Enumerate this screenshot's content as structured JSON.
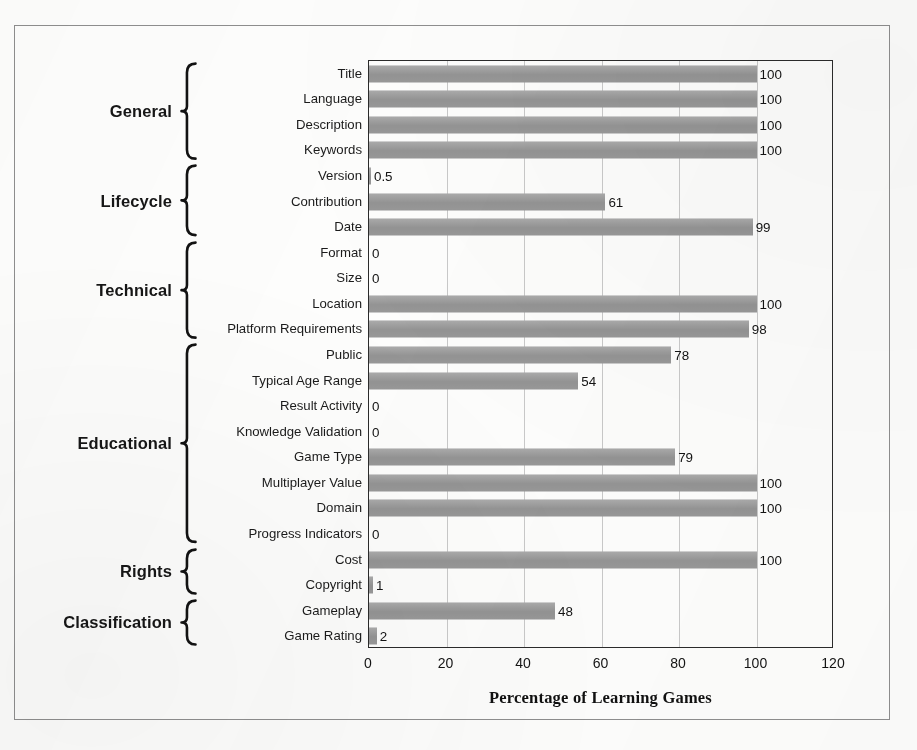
{
  "figure": {
    "kind": "horizontal-bar-chart",
    "frame_border_color": "#8e8e8e",
    "bar_color": "#9b9b9b",
    "axis_color": "#2b2b2b",
    "gridline_color": "#c9c9c9"
  },
  "chart_data": {
    "type": "bar",
    "orientation": "horizontal",
    "title": "",
    "xlabel": "Percentage of Learning Games",
    "ylabel": "",
    "xlim": [
      0,
      120
    ],
    "xticks": [
      0,
      20,
      40,
      60,
      80,
      100,
      120
    ],
    "grid": true,
    "legend": "none",
    "categories": [
      "Title",
      "Language",
      "Description",
      "Keywords",
      "Version",
      "Contribution",
      "Date",
      "Format",
      "Size",
      "Location",
      "Platform Requirements",
      "Public",
      "Typical Age Range",
      "Result Activity",
      "Knowledge Validation",
      "Game Type",
      "Multiplayer Value",
      "Domain",
      "Progress Indicators",
      "Cost",
      "Copyright",
      "Gameplay",
      "Game Rating"
    ],
    "values": [
      100,
      100,
      100,
      100,
      0.5,
      61,
      99,
      0,
      0,
      100,
      98,
      78,
      54,
      0,
      0,
      79,
      100,
      100,
      0,
      100,
      1,
      48,
      2
    ],
    "value_labels": [
      "100",
      "100",
      "100",
      "100",
      "0.5",
      "61",
      "99",
      "0",
      "0",
      "100",
      "98",
      "78",
      "54",
      "0",
      "0",
      "79",
      "100",
      "100",
      "0",
      "100",
      "1",
      "48",
      "2"
    ]
  },
  "groups": [
    {
      "label": "General",
      "start": 0,
      "end": 3
    },
    {
      "label": "Lifecycle",
      "start": 4,
      "end": 6
    },
    {
      "label": "Technical",
      "start": 7,
      "end": 10
    },
    {
      "label": "Educational",
      "start": 11,
      "end": 18
    },
    {
      "label": "Rights",
      "start": 19,
      "end": 20
    },
    {
      "label": "Classification",
      "start": 21,
      "end": 22
    }
  ]
}
